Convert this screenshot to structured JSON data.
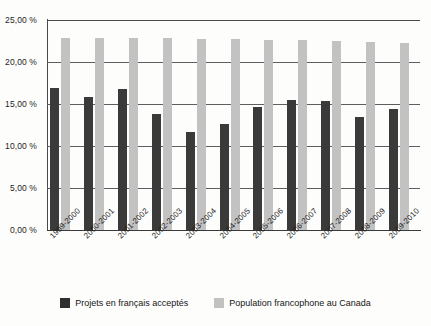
{
  "chart_data": {
    "type": "bar",
    "title": "",
    "subtitle": "",
    "xlabel": "",
    "ylabel": "",
    "ylim": [
      0,
      25
    ],
    "y_ticks": [
      0,
      5,
      10,
      15,
      20,
      25
    ],
    "y_tick_labels": [
      "0,00 %",
      "5,00 %",
      "10,00 %",
      "15,00 %",
      "20,00 %",
      "25,00 %"
    ],
    "grid": true,
    "legend_position": "bottom",
    "categories": [
      "1999-2000",
      "2000-2001",
      "2001-2002",
      "2002-2003",
      "2003-2004",
      "2004-2005",
      "2005-2006",
      "2006-2007",
      "2007-2008",
      "2008-2009",
      "2009-2010"
    ],
    "series": [
      {
        "name": "Projets en français acceptés",
        "color": "#3a3a3a",
        "values": [
          16.9,
          15.8,
          16.8,
          13.8,
          11.7,
          12.6,
          14.6,
          15.5,
          15.4,
          13.4,
          14.4
        ]
      },
      {
        "name": "Population francophone au Canada",
        "color": "#c2c2c2",
        "values": [
          22.9,
          22.9,
          22.8,
          22.8,
          22.7,
          22.7,
          22.6,
          22.6,
          22.5,
          22.4,
          22.3
        ]
      }
    ]
  },
  "legend": {
    "items": [
      {
        "label": "Projets en français acceptés",
        "swatch": "dark-swatch"
      },
      {
        "label": "Population francophone au Canada",
        "swatch": "light-swatch"
      }
    ]
  }
}
